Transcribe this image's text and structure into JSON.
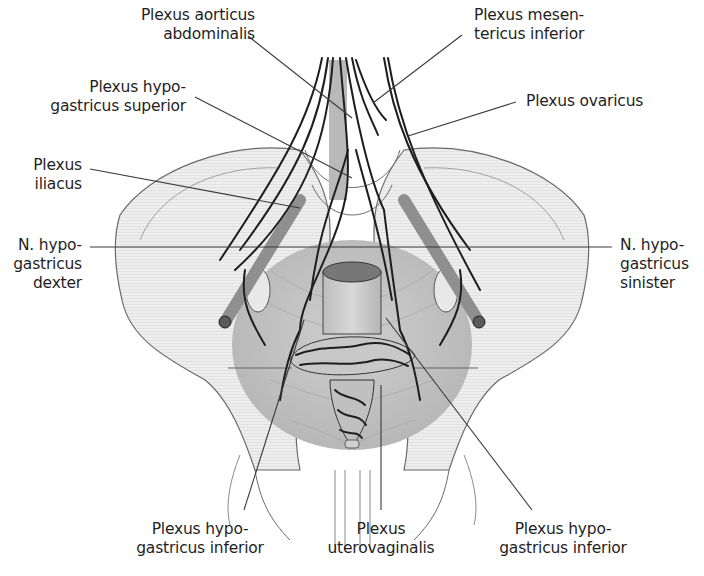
{
  "figure": {
    "colors": {
      "background": "#ffffff",
      "bone_fill": "#ececec",
      "bone_outline": "#6a6a6a",
      "pelvic_floor": "#bdbdbd",
      "nerve": "#1e1e1e",
      "vessel": "#9a9a9a",
      "leader_line": "#3a3a3a",
      "text": "#1f1f1f"
    }
  },
  "labels": {
    "aorticus": {
      "line1": "Plexus aorticus",
      "line2": "abdominalis"
    },
    "mesentericus": {
      "line1": "Plexus mesen-",
      "line2": "tericus inferior"
    },
    "hypo_superior": {
      "line1": "Plexus hypo-",
      "line2": "gastricus superior"
    },
    "ovaricus": {
      "line1": "Plexus ovaricus"
    },
    "iliacus": {
      "line1": "Plexus",
      "line2": "iliacus"
    },
    "n_dexter": {
      "line1": "N. hypo-",
      "line2": "gastricus",
      "line3": "dexter"
    },
    "n_sinister": {
      "line1": "N. hypo-",
      "line2": "gastricus",
      "line3": "sinister"
    },
    "hypo_inferior_left": {
      "line1": "Plexus hypo-",
      "line2": "gastricus inferior"
    },
    "uterovaginalis": {
      "line1": "Plexus",
      "line2": "uterovaginalis"
    },
    "hypo_inferior_right": {
      "line1": "Plexus hypo-",
      "line2": "gastricus inferior"
    }
  }
}
